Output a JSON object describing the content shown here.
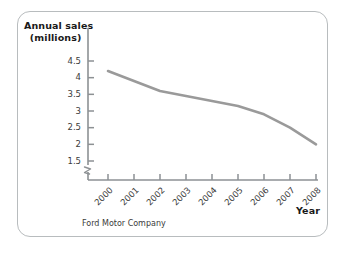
{
  "figure": {
    "source_caption": "Ford Motor Company",
    "border_color": "#b8bcbe",
    "background_color": "#ffffff"
  },
  "chart_data": {
    "type": "line",
    "title": "",
    "subtitle": "",
    "ylabel_line1": "Annual sales",
    "ylabel_line2": "(millions)",
    "xlabel": "Year",
    "categories": [
      "2000",
      "2001",
      "2002",
      "2003",
      "2004",
      "2005",
      "2006",
      "2007",
      "2008"
    ],
    "x": [
      2000,
      2001,
      2002,
      2003,
      2004,
      2005,
      2006,
      2007,
      2008
    ],
    "values": [
      4.2,
      3.9,
      3.6,
      3.45,
      3.3,
      3.15,
      2.9,
      2.5,
      2.0
    ],
    "series": [
      {
        "name": "Ford Motor Company annual sales",
        "values": [
          4.2,
          3.9,
          3.6,
          3.45,
          3.3,
          3.15,
          2.9,
          2.5,
          2.0
        ],
        "color": "#9a9a9a"
      }
    ],
    "ytick_labels": [
      "4.5",
      "4",
      "3.5",
      "3",
      "2.5",
      "2",
      "1.5"
    ],
    "ytick_values": [
      4.5,
      4,
      3.5,
      3,
      2.5,
      2,
      1.5
    ],
    "ylim": [
      1.5,
      4.5
    ],
    "xlim": [
      2000,
      2008
    ],
    "y_axis_break": true,
    "grid": false,
    "legend": false,
    "legend_position": "none",
    "line_color": "#9a9a9a",
    "axis_color": "#8d9194",
    "annotations": []
  }
}
